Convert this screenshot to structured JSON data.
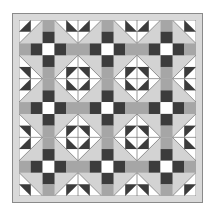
{
  "quilt": {
    "grid_units": 15,
    "colors": {
      "page_background": "#ffffff",
      "frame": "#d9d9d9",
      "frame_outline": "#8a8a8a",
      "block_background": "#d3d3d3",
      "sashing_grey": "#a6a6a6",
      "dark": "#3c3c3c",
      "white": "#ffffff",
      "seam_line": "#6e6e6e"
    },
    "sashing": {
      "positions": [
        2,
        7,
        12
      ],
      "sequence": [
        "grey",
        "dark",
        "white",
        "dark",
        "grey",
        "grey",
        "dark",
        "white",
        "dark",
        "grey",
        "grey",
        "dark",
        "white",
        "dark",
        "grey"
      ]
    },
    "block": {
      "type": "square-in-a-square diamond",
      "size_units": 4,
      "centers": [
        0,
        5,
        10,
        15
      ],
      "layout": "full blocks in interior, half blocks along edges, quarter blocks at corners"
    }
  }
}
